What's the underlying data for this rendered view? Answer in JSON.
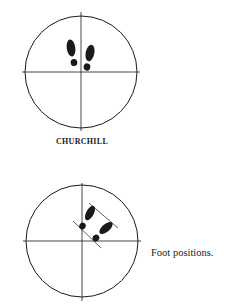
{
  "figure_1": {
    "label": "CHURCHILL",
    "circle": {
      "cx": 81,
      "cy": 72,
      "r": 56
    },
    "axes": {
      "horizontal": [
        22,
        72,
        140,
        72
      ],
      "vertical": [
        81,
        12,
        81,
        131
      ]
    },
    "feet": "two footprints side by side, toes pointing up, just above center"
  },
  "figure_2": {
    "caption": "Foot positions.",
    "circle": {
      "cx": 82,
      "cy": 241,
      "r": 56
    },
    "axes": {
      "horizontal": [
        23,
        241,
        141,
        241
      ],
      "vertical": [
        82,
        183,
        82,
        301
      ]
    },
    "feet": "two footprints angled diagonally toward upper-right between two parallel guide lines"
  },
  "colors": {
    "ink": "#1a1a1a",
    "background": "#ffffff"
  }
}
